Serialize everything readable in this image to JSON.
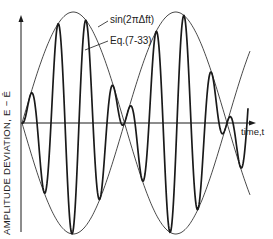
{
  "figure": {
    "y_axis_label": "AMPLITUDE  DEVIATION, E − Ē",
    "x_axis_label": "time,t",
    "annotations": [
      {
        "text": "sin(2πΔft)",
        "refers_to": "envelope"
      },
      {
        "text": "Eq.(7-33)",
        "refers_to": "carrier"
      }
    ],
    "colors": {
      "line": "#1a1a1a",
      "background": "#ffffff"
    }
  },
  "geometry": {
    "axis_x": 21,
    "axis_top": 15,
    "axis_bottom": 232,
    "baseline_y": 123,
    "xaxis_end": 256,
    "env_x0": 22,
    "env_period": 205,
    "env_amp": 111,
    "env_end": 250,
    "car_period": 28,
    "car_phase": 8,
    "car_end": 248
  }
}
